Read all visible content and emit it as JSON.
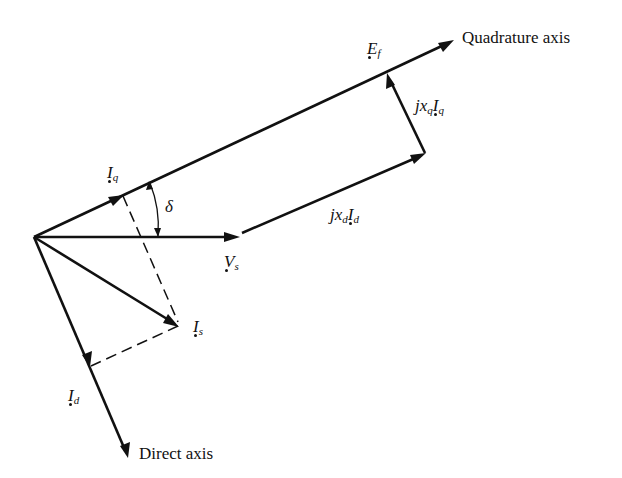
{
  "diagram": {
    "type": "phasor-diagram",
    "colors": {
      "ink": "#111111",
      "background": "#ffffff"
    },
    "axes": {
      "quadrature": {
        "label": "Quadrature axis"
      },
      "direct": {
        "label": "Direct axis"
      }
    },
    "phasors": {
      "Ef": {
        "symbol": "E",
        "subscript": "f"
      },
      "Vs": {
        "symbol": "V",
        "subscript": "s"
      },
      "Iq": {
        "symbol": "I",
        "subscript": "q"
      },
      "Id": {
        "symbol": "I",
        "subscript": "d"
      },
      "Is": {
        "symbol": "I",
        "subscript": "s"
      },
      "jxdId": {
        "prefix": "jx",
        "prefix_sub": "d",
        "symbol": "I",
        "subscript": "d"
      },
      "jxqIq": {
        "prefix": "jx",
        "prefix_sub": "q",
        "symbol": "I",
        "subscript": "q"
      }
    },
    "angle": {
      "symbol": "δ",
      "between": [
        "Vs",
        "Quadrature axis"
      ]
    }
  }
}
